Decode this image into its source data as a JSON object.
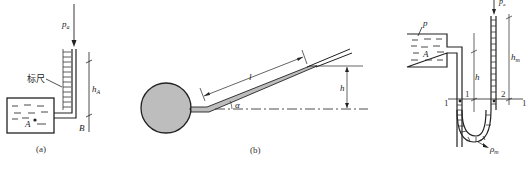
{
  "figure_a": {
    "caption": "(a)",
    "labels": {
      "pressure": "p",
      "pressure_sub": "a",
      "scale": "标尺",
      "height": "h",
      "height_sub": "A",
      "point_a": "A",
      "point_b": "B"
    }
  },
  "figure_b": {
    "caption": "(b)",
    "labels": {
      "length": "l",
      "height": "h",
      "angle": "α"
    }
  },
  "figure_c": {
    "labels": {
      "pressure_top": "p",
      "pressure_top_sub": "a",
      "pressure_vessel": "p",
      "vessel": "A",
      "height": "h",
      "height_m": "h",
      "height_m_sub": "m",
      "section_left": "1",
      "section_right": "1",
      "point_1": "1",
      "point_2": "2",
      "fluid_density": "ρ",
      "fluid_density_sub": "m"
    }
  },
  "colors": {
    "line": "#222222",
    "fill_gray": "#bdbdbd"
  }
}
